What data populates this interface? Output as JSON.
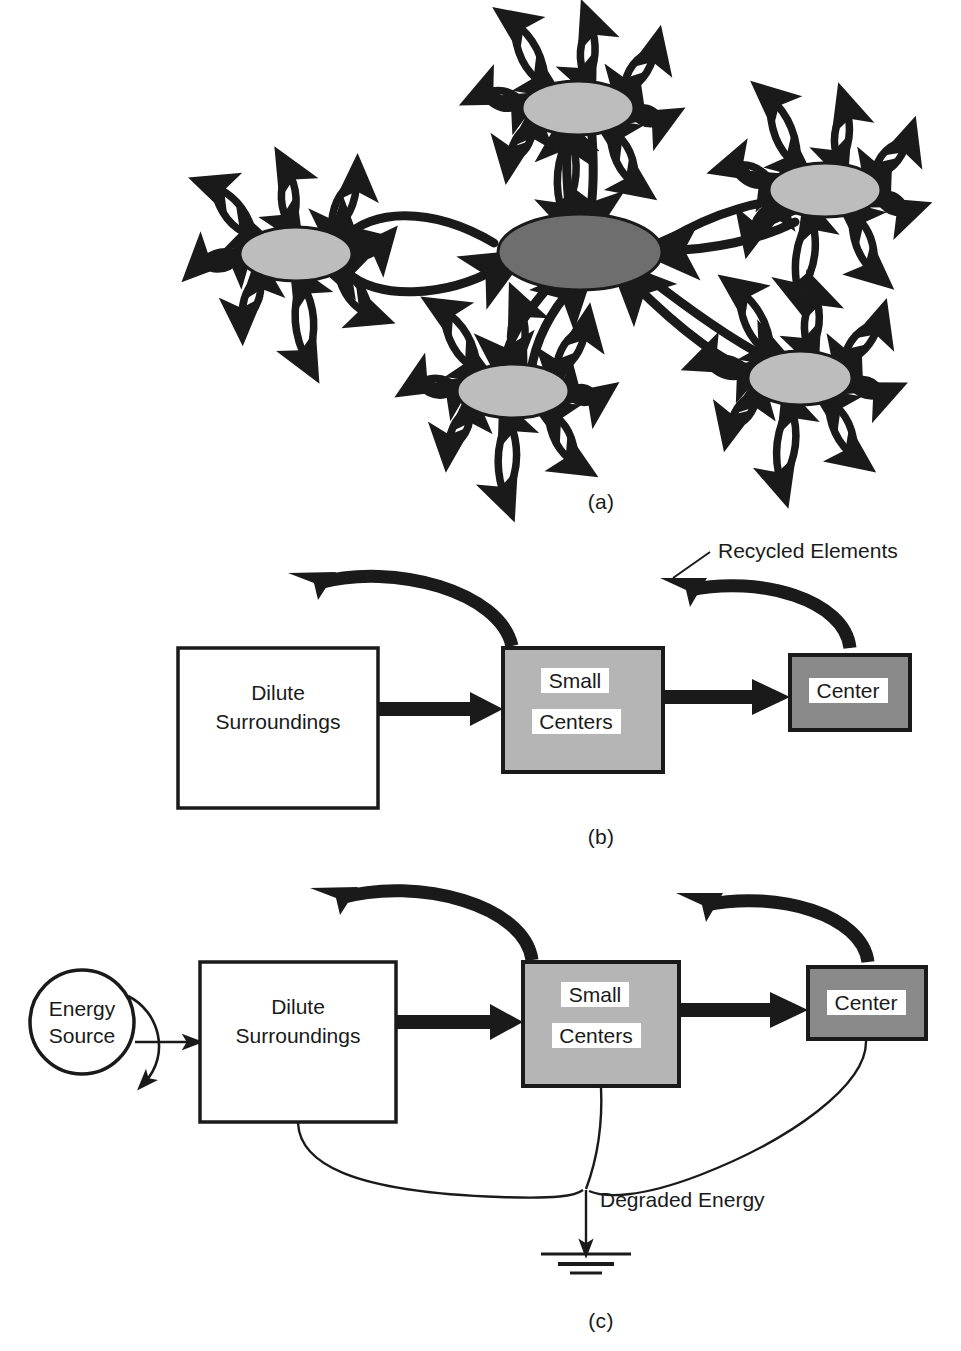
{
  "figure": {
    "background_color": "#ffffff",
    "ink_color": "#1a1a1a",
    "panels": [
      {
        "id": "a",
        "caption": "(a)",
        "type": "network",
        "description": "Hub-and-spoke network of shaded elliptical nodes connected by thick double-headed curved arrows, each node also radiating paired exchange arrows outward."
      },
      {
        "id": "b",
        "caption": "(b)",
        "type": "flow",
        "description": "Three-stage linear flow with recycling arcs."
      },
      {
        "id": "c",
        "caption": "(c)",
        "type": "flow",
        "description": "Same three-stage flow with energy source input and degraded energy sink."
      }
    ]
  },
  "panel_a": {
    "caption": "(a)",
    "center_node": {
      "name": "center-node",
      "fill": "#6e6e6e",
      "cx": 580,
      "cy": 252,
      "rx": 82,
      "ry": 38
    },
    "satellite_nodes": [
      {
        "name": "node-top",
        "fill": "#bdbdbd",
        "cx": 578,
        "cy": 108,
        "rx": 56,
        "ry": 27,
        "spokes": 8,
        "spoke_rotation": 8
      },
      {
        "name": "node-right",
        "fill": "#bdbdbd",
        "cx": 825,
        "cy": 190,
        "rx": 56,
        "ry": 27,
        "spokes": 8,
        "spoke_rotation": 14
      },
      {
        "name": "node-left",
        "fill": "#bdbdbd",
        "cx": 296,
        "cy": 254,
        "rx": 56,
        "ry": 27,
        "spokes": 8,
        "spoke_rotation": -6
      },
      {
        "name": "node-bottom-left",
        "fill": "#bdbdbd",
        "cx": 513,
        "cy": 391,
        "rx": 56,
        "ry": 27,
        "spokes": 8,
        "spoke_rotation": 4
      },
      {
        "name": "node-bottom-right",
        "fill": "#bdbdbd",
        "cx": 800,
        "cy": 378,
        "rx": 52,
        "ry": 27,
        "spokes": 8,
        "spoke_rotation": 10
      }
    ],
    "hub_links": [
      {
        "name": "link-center-top",
        "from": "center-node",
        "to": "node-top",
        "style": "double-headed"
      },
      {
        "name": "link-center-right",
        "from": "center-node",
        "to": "node-right",
        "style": "double-headed"
      },
      {
        "name": "link-center-left",
        "from": "center-node",
        "to": "node-left",
        "style": "double-headed"
      },
      {
        "name": "link-center-bottom-left",
        "from": "center-node",
        "to": "node-bottom-left",
        "style": "double-headed"
      },
      {
        "name": "link-center-bottom-right",
        "from": "center-node",
        "to": "node-bottom-right",
        "style": "double-headed"
      }
    ]
  },
  "panel_b": {
    "caption": "(b)",
    "boxes": [
      {
        "name": "dilute-surroundings-box",
        "lines": [
          "Dilute",
          "Surroundings"
        ],
        "fill": "#ffffff",
        "stroke": "#1a1a1a",
        "text_background": "none",
        "x": 178,
        "y": 648,
        "w": 200,
        "h": 160
      },
      {
        "name": "small-centers-box",
        "lines": [
          "Small",
          "Centers"
        ],
        "fill": "#b5b5b5",
        "stroke": "#1a1a1a",
        "text_background": "#ffffff",
        "x": 503,
        "y": 648,
        "w": 160,
        "h": 124
      },
      {
        "name": "center-box",
        "lines": [
          "Center"
        ],
        "fill": "#8a8a8a",
        "stroke": "#1a1a1a",
        "text_background": "#ffffff",
        "x": 790,
        "y": 655,
        "w": 120,
        "h": 75
      }
    ],
    "flow_arrows": [
      {
        "name": "arrow-dilute-to-small",
        "label": "",
        "from": "dilute-surroundings-box",
        "to": "small-centers-box"
      },
      {
        "name": "arrow-small-to-center",
        "label": "",
        "from": "small-centers-box",
        "to": "center-box"
      }
    ],
    "recycle_arcs": [
      {
        "name": "recycle-arc-small-to-dilute",
        "from": "small-centers-box",
        "to": "dilute-surroundings-box"
      },
      {
        "name": "recycle-arc-center-to-small",
        "from": "center-box",
        "to": "small-centers-box"
      }
    ],
    "annotations": [
      {
        "name": "recycled-elements-label",
        "text": "Recycled Elements",
        "x": 700,
        "y": 560
      }
    ]
  },
  "panel_c": {
    "caption": "(c)",
    "energy_source": {
      "name": "energy-source-node",
      "lines": [
        "Energy",
        "Source"
      ],
      "shape": "circle",
      "fill": "#ffffff",
      "stroke": "#1a1a1a",
      "cx": 82,
      "cy": 1022,
      "r": 52
    },
    "boxes": [
      {
        "name": "dilute-surroundings-box",
        "lines": [
          "Dilute",
          "Surroundings"
        ],
        "fill": "#ffffff",
        "stroke": "#1a1a1a",
        "text_background": "none",
        "x": 200,
        "y": 962,
        "w": 196,
        "h": 160
      },
      {
        "name": "small-centers-box",
        "lines": [
          "Small",
          "Centers"
        ],
        "fill": "#b5b5b5",
        "stroke": "#1a1a1a",
        "text_background": "#ffffff",
        "x": 523,
        "y": 962,
        "w": 156,
        "h": 124
      },
      {
        "name": "center-box",
        "lines": [
          "Center"
        ],
        "fill": "#8a8a8a",
        "stroke": "#1a1a1a",
        "text_background": "#ffffff",
        "x": 808,
        "y": 967,
        "w": 118,
        "h": 72
      }
    ],
    "flow_arrows": [
      {
        "name": "arrow-energy-to-dilute",
        "from": "energy-source-node",
        "to": "dilute-surroundings-box",
        "weight": "thin"
      },
      {
        "name": "arrow-dilute-to-small",
        "from": "dilute-surroundings-box",
        "to": "small-centers-box",
        "weight": "thick"
      },
      {
        "name": "arrow-small-to-center",
        "from": "small-centers-box",
        "to": "center-box",
        "weight": "thick"
      }
    ],
    "recycle_arcs": [
      {
        "name": "recycle-arc-small-to-dilute",
        "from": "small-centers-box",
        "to": "dilute-surroundings-box"
      },
      {
        "name": "recycle-arc-center-to-small",
        "from": "center-box",
        "to": "small-centers-box"
      }
    ],
    "energy_sink": {
      "name": "degraded-energy-sink",
      "label": "Degraded Energy",
      "label_x": 600,
      "label_y": 1207,
      "ground_symbol": {
        "name": "ground-symbol",
        "bars": 3,
        "x": 574,
        "y": 1252
      },
      "loss_paths": [
        {
          "name": "loss-path-dilute",
          "from": "dilute-surroundings-box"
        },
        {
          "name": "loss-path-small",
          "from": "small-centers-box"
        },
        {
          "name": "loss-path-center",
          "from": "center-box"
        }
      ]
    }
  },
  "colors": {
    "ink": "#1a1a1a",
    "node_light": "#bdbdbd",
    "node_dark": "#6e6e6e",
    "box_mid_gray": "#b5b5b5",
    "box_dark_gray": "#8a8a8a",
    "white": "#ffffff"
  }
}
